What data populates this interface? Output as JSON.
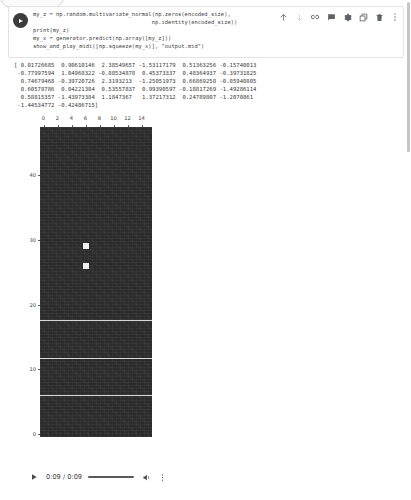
{
  "cell": {
    "run_button": "run-cell",
    "code_lines": [
      "my_z = np.random.multivariate_normal(np.zeros(encoded_size),",
      "                                    np.identity(encoded_size))",
      "print(my_z)",
      "my_x = generator.predict(np.array([my_z]))",
      "show_and_play_midi([np.squeeze(my_x)], \"output.mid\")"
    ],
    "toolbar": [
      {
        "name": "move-cell-up-icon",
        "label": "Move cell up"
      },
      {
        "name": "move-cell-down-icon",
        "label": "Move cell down"
      },
      {
        "name": "link-to-cell-icon",
        "label": "Link to cell"
      },
      {
        "name": "add-comment-icon",
        "label": "Add comment"
      },
      {
        "name": "cell-settings-icon",
        "label": "Editor settings"
      },
      {
        "name": "mirror-cell-icon",
        "label": "Mirror cell in tab"
      },
      {
        "name": "delete-cell-icon",
        "label": "Delete cell"
      },
      {
        "name": "more-options-icon",
        "label": "More cell actions"
      }
    ]
  },
  "output": {
    "array_lines": [
      "[ 0.01726685  0.90610146  2.38549657 -1.53117179  0.51363256 -0.15740013",
      " -0.77997594  1.04968322 -0.88534878  0.45373337  0.48364937 -0.39731825",
      "  0.74679468 -0.39720726  2.3193213  -1.25051973  0.66869258 -0.05940805",
      "  0.60578786  0.04221384  0.53557837  0.99390597 -0.18817269 -1.49286114",
      "  0.58815357 -1.43973384  1.1847367   1.37217312  0.24789807 -1.2070861",
      " -1.44534772 -0.42486715]"
    ]
  },
  "chart_data": {
    "type": "heatmap",
    "title": "",
    "xlabel": "",
    "ylabel": "",
    "xticks": [
      0,
      2,
      4,
      6,
      8,
      10,
      12,
      14
    ],
    "yticks": [
      0,
      10,
      20,
      30,
      40
    ],
    "xlim": [
      -0.5,
      15.5
    ],
    "ylim": [
      47.5,
      -0.5
    ],
    "grid": false,
    "colormap": "gray",
    "background_value": "dark",
    "annotations": [
      {
        "kind": "row-band",
        "row_start": 6.0,
        "row_end": 7.0,
        "value": "light",
        "description": "full-width light horizontal band"
      },
      {
        "kind": "row-band",
        "row_start": 11.8,
        "row_end": 12.8,
        "value": "light",
        "description": "full-width light horizontal band"
      },
      {
        "kind": "row-band",
        "row_start": 17.6,
        "row_end": 18.6,
        "value": "light",
        "description": "full-width light horizontal band"
      },
      {
        "kind": "cell",
        "row": 26.0,
        "col": 6.0,
        "value": "light",
        "description": "single bright pixel"
      },
      {
        "kind": "cell",
        "row": 29.0,
        "col": 6.0,
        "value": "light",
        "description": "single bright pixel"
      }
    ]
  },
  "audio": {
    "play_label": "play",
    "time": "0:09 / 0:09",
    "progress_percent": 100,
    "volume_label": "volume",
    "more_label": "more options"
  }
}
